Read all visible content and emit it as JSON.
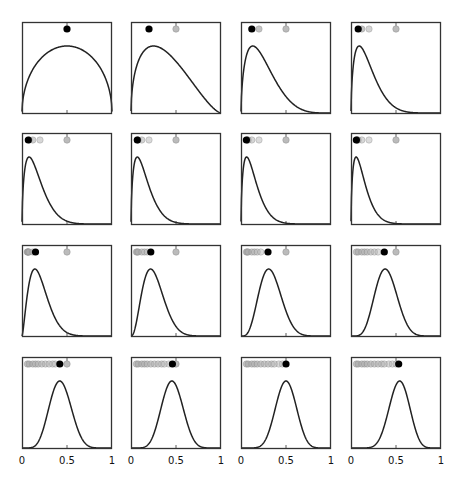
{
  "chart_data": {
    "type": "line",
    "title": "",
    "layout": {
      "rows": 4,
      "cols": 4,
      "grid": false,
      "legend": "none"
    },
    "xlabel": "",
    "ylabel": "",
    "xlim": [
      0,
      1
    ],
    "xticks": [
      0,
      0.5,
      1
    ],
    "xtick_labels": [
      "0",
      "0.5",
      "1"
    ],
    "colors": {
      "curve": "#222222",
      "frame": "#333333",
      "current_dot": "#000000",
      "past_dot": "#999999",
      "ref_dot": "#bbbbbb"
    },
    "panels": [
      {
        "index": 1,
        "alpha": 1.5,
        "beta": 1.5,
        "mean_dot": 0.5,
        "ref_dot": null,
        "history": []
      },
      {
        "index": 2,
        "alpha": 1.5,
        "beta": 2.5,
        "mean_dot": 0.2,
        "ref_dot": 0.5,
        "history": []
      },
      {
        "index": 3,
        "alpha": 1.6,
        "beta": 5.0,
        "mean_dot": 0.12,
        "ref_dot": 0.5,
        "history": [
          0.2
        ]
      },
      {
        "index": 4,
        "alpha": 1.6,
        "beta": 7.0,
        "mean_dot": 0.08,
        "ref_dot": 0.5,
        "history": [
          0.12,
          0.2
        ]
      },
      {
        "index": 5,
        "alpha": 1.6,
        "beta": 8.0,
        "mean_dot": 0.07,
        "ref_dot": 0.5,
        "history": [
          0.08,
          0.12,
          0.2
        ]
      },
      {
        "index": 6,
        "alpha": 1.6,
        "beta": 9.0,
        "mean_dot": 0.07,
        "ref_dot": 0.5,
        "history": [
          0.07,
          0.08,
          0.12,
          0.2
        ]
      },
      {
        "index": 7,
        "alpha": 1.6,
        "beta": 10.0,
        "mean_dot": 0.06,
        "ref_dot": 0.5,
        "history": [
          0.07,
          0.07,
          0.08,
          0.12,
          0.2
        ]
      },
      {
        "index": 8,
        "alpha": 1.6,
        "beta": 11.0,
        "mean_dot": 0.06,
        "ref_dot": 0.5,
        "history": [
          0.06,
          0.07,
          0.07,
          0.08,
          0.12,
          0.2
        ]
      },
      {
        "index": 9,
        "alpha": 2.5,
        "beta": 10.0,
        "mean_dot": 0.15,
        "ref_dot": 0.5,
        "history": [
          0.06,
          0.06,
          0.07,
          0.07,
          0.08,
          0.12
        ]
      },
      {
        "index": 10,
        "alpha": 3.5,
        "beta": 10.0,
        "mean_dot": 0.22,
        "ref_dot": 0.5,
        "history": [
          0.06,
          0.07,
          0.08,
          0.12,
          0.15,
          0.18
        ]
      },
      {
        "index": 11,
        "alpha": 5.0,
        "beta": 10.0,
        "mean_dot": 0.3,
        "ref_dot": 0.5,
        "history": [
          0.06,
          0.07,
          0.08,
          0.12,
          0.15,
          0.18,
          0.22
        ]
      },
      {
        "index": 12,
        "alpha": 6.5,
        "beta": 10.0,
        "mean_dot": 0.37,
        "ref_dot": 0.5,
        "history": [
          0.06,
          0.08,
          0.12,
          0.15,
          0.18,
          0.22,
          0.26,
          0.3
        ]
      },
      {
        "index": 13,
        "alpha": 7.5,
        "beta": 10.0,
        "mean_dot": 0.42,
        "ref_dot": 0.5,
        "history": [
          0.06,
          0.08,
          0.12,
          0.15,
          0.18,
          0.22,
          0.26,
          0.3,
          0.34,
          0.37
        ]
      },
      {
        "index": 14,
        "alpha": 8.5,
        "beta": 10.0,
        "mean_dot": 0.46,
        "ref_dot": 0.5,
        "history": [
          0.06,
          0.08,
          0.12,
          0.15,
          0.18,
          0.22,
          0.26,
          0.3,
          0.34,
          0.37,
          0.42
        ]
      },
      {
        "index": 15,
        "alpha": 10.0,
        "beta": 10.0,
        "mean_dot": 0.5,
        "ref_dot": null,
        "history": [
          0.06,
          0.08,
          0.12,
          0.15,
          0.18,
          0.22,
          0.26,
          0.3,
          0.34,
          0.37,
          0.42,
          0.46
        ]
      },
      {
        "index": 16,
        "alpha": 11.0,
        "beta": 9.5,
        "mean_dot": 0.53,
        "ref_dot": null,
        "history": [
          0.06,
          0.08,
          0.12,
          0.15,
          0.18,
          0.22,
          0.26,
          0.3,
          0.34,
          0.37,
          0.42,
          0.46,
          0.5
        ]
      }
    ],
    "panel_geometry": {
      "col_left": [
        22,
        131,
        241,
        351
      ],
      "row_top": [
        22,
        133,
        245,
        357
      ],
      "width": 90,
      "height": 92
    }
  },
  "axis_labels": {
    "tick0": "0",
    "tick05": "0.5",
    "tick1": "1"
  }
}
